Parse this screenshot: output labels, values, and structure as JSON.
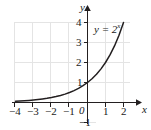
{
  "chart_data": {
    "type": "line",
    "title": "",
    "xlabel": "x",
    "ylabel": "y",
    "xlim": [
      -4.6,
      2.9
    ],
    "ylim": [
      -1.4,
      4.6
    ],
    "grid": true,
    "grid_color": "#e2e2e2",
    "axis_color": "#231f20",
    "curve_color": "#231f20",
    "legend_position": "inside-upper-right",
    "xticks": [
      -4,
      -3,
      -2,
      -1,
      0,
      1,
      2
    ],
    "xtick_labels": [
      "−4",
      "−3",
      "−2",
      "−1",
      "0",
      "1",
      "2"
    ],
    "yticks": [
      -1,
      1,
      2,
      3,
      4
    ],
    "ytick_labels": [
      "−1",
      "1",
      "2",
      "3",
      "4"
    ],
    "series": [
      {
        "name": "y = 2ˣ",
        "equation_base": "y = 2",
        "equation_exponent": "x",
        "x": [
          -4.0,
          -3.75,
          -3.5,
          -3.25,
          -3.0,
          -2.75,
          -2.5,
          -2.25,
          -2.0,
          -1.75,
          -1.5,
          -1.25,
          -1.0,
          -0.75,
          -0.5,
          -0.25,
          0.0,
          0.25,
          0.5,
          0.75,
          1.0,
          1.25,
          1.5,
          1.75,
          2.0
        ],
        "values": [
          0.063,
          0.074,
          0.088,
          0.105,
          0.125,
          0.149,
          0.177,
          0.21,
          0.25,
          0.297,
          0.354,
          0.42,
          0.5,
          0.595,
          0.707,
          0.841,
          1.0,
          1.189,
          1.414,
          1.682,
          2.0,
          2.378,
          2.828,
          3.364,
          4.0
        ]
      }
    ],
    "annotations": [
      {
        "text": "y = 2ˣ",
        "x": 0.35,
        "y": 3.55
      }
    ]
  }
}
